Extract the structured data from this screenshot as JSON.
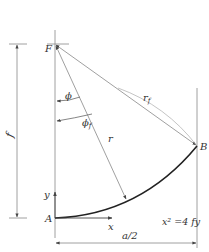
{
  "diagram": {
    "type": "geometry",
    "points": {
      "F": {
        "label": "F"
      },
      "A": {
        "label": "A"
      },
      "B": {
        "label": "B"
      }
    },
    "labels": {
      "focus": "F",
      "origin": "A",
      "endpoint": "B",
      "radius_f": "r",
      "radius_f_sub": "f",
      "radius": "r",
      "angle": "ϕ",
      "angle_f": "ϕ",
      "angle_f_sub": "f",
      "height_dim": "f",
      "width_dim": "a/2",
      "axis_x": "x",
      "axis_y": "y",
      "equation": "x² =4 fy"
    },
    "colors": {
      "line": "#7a7a7a",
      "curve": "#2a2a2a",
      "text": "#333333"
    }
  }
}
